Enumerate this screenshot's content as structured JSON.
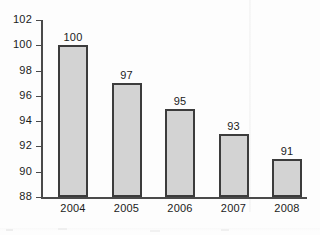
{
  "chart_data": {
    "type": "bar",
    "title": "",
    "subtitle": "",
    "xlabel": "",
    "ylabel": "",
    "categories": [
      "2004",
      "2005",
      "2006",
      "2007",
      "2008"
    ],
    "values": [
      100,
      97,
      95,
      93,
      91
    ],
    "data_labels": [
      "100",
      "97",
      "95",
      "93",
      "91"
    ],
    "ylim": [
      88,
      102
    ],
    "yticks": [
      88,
      90,
      92,
      94,
      96,
      98,
      100,
      102
    ],
    "ytick_labels": [
      "88",
      "90",
      "92",
      "94",
      "96",
      "98",
      "100",
      "102"
    ],
    "grid": false,
    "legend": false,
    "legend_position": "none",
    "bar_fill_color": "#d3d3d3",
    "bar_border_color": "#3c3c3c",
    "axis_color": "#4a4a4a",
    "text_color": "#1b1b1b",
    "background_color": "#fdfdfd"
  }
}
